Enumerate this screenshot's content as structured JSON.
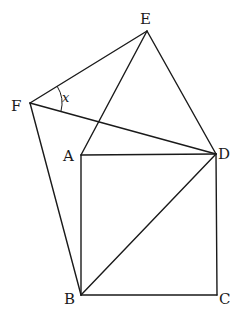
{
  "diagram": {
    "type": "geometry",
    "points": {
      "A": {
        "label": "A",
        "x": 81,
        "y": 155
      },
      "B": {
        "label": "B",
        "x": 81,
        "y": 295
      },
      "C": {
        "label": "C",
        "x": 217,
        "y": 295
      },
      "D": {
        "label": "D",
        "x": 216,
        "y": 154
      },
      "E": {
        "label": "E",
        "x": 147,
        "y": 31
      },
      "F": {
        "label": "F",
        "x": 30,
        "y": 103
      }
    },
    "segments": [
      "AB",
      "BC",
      "CD",
      "DA",
      "BD",
      "AE",
      "ED",
      "FE",
      "FD",
      "FB"
    ],
    "angle_label": "x",
    "angle_vertex": "F"
  }
}
